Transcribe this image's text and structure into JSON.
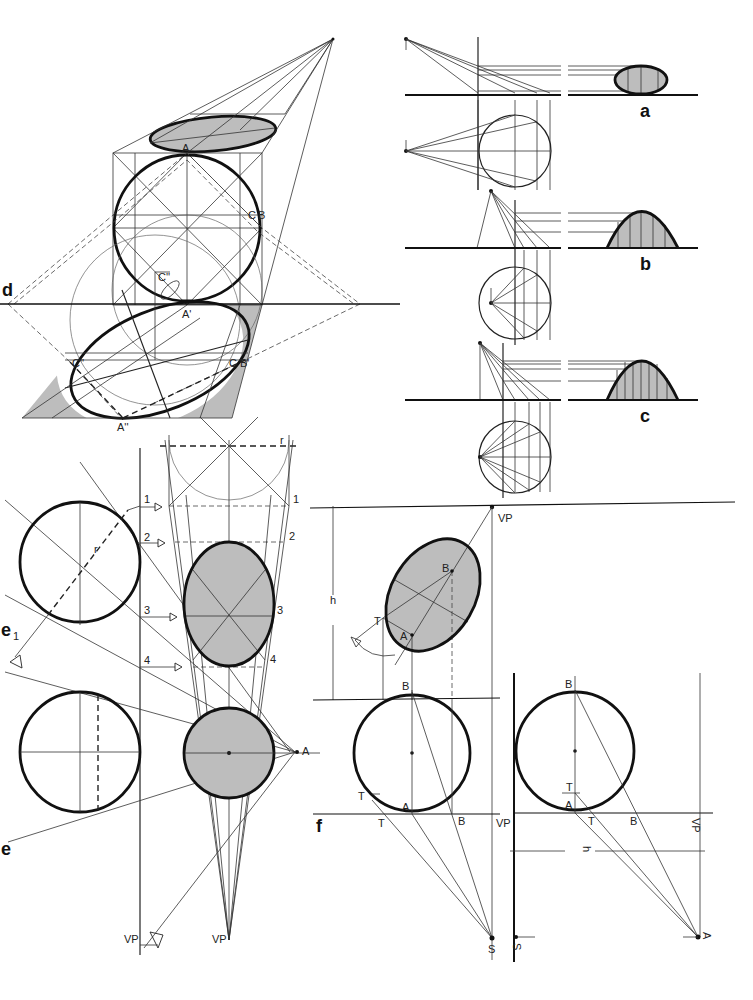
{
  "figure": {
    "panel_labels": {
      "a": "a",
      "b": "b",
      "c": "c",
      "d": "d",
      "e": "e",
      "e1": "e",
      "e1_sub": "1",
      "f": "f"
    },
    "panel_d": {
      "points": {
        "A": "A",
        "A_prime": "A'",
        "A_double": "A''",
        "B": "B",
        "B_prime": "B'",
        "C_B": "C",
        "C_double_top": "C''",
        "C_double_left": "C''",
        "C_right": "C"
      }
    },
    "panel_e": {
      "radius_label": "r",
      "radius_label_circle": "r",
      "numbers": [
        "1",
        "2",
        "3",
        "4"
      ],
      "numbers_right": [
        "1",
        "2",
        "3",
        "4"
      ],
      "point_A": "A",
      "vp_left": "VP",
      "vp_center": "VP"
    },
    "panel_f": {
      "h_label": "h",
      "vp_top": "VP",
      "B_top": "B",
      "A_top": "A",
      "T_top": "T",
      "left": {
        "B_top": "B",
        "T_upper": "T",
        "A": "A",
        "T_lower": "T",
        "B_lower": "B",
        "VP": "VP",
        "S": "S"
      },
      "right": {
        "B_top": "B",
        "T_upper": "T",
        "A": "A",
        "T_lower": "T",
        "B_lower": "B",
        "VP": "VP",
        "h": "h",
        "S": "S",
        "A_bottom": "A"
      }
    }
  }
}
